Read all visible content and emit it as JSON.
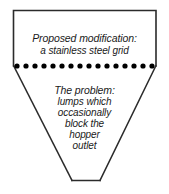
{
  "figure": {
    "kind": "hopper-cross-section-diagram",
    "background_color": "#ffffff",
    "outline_color": "#2b2b2b",
    "dot_color": "#000000",
    "text_color": "#1a1a1a"
  },
  "upper_annotation": {
    "heading": "Proposed modification:",
    "detail": "a stainless steel grid"
  },
  "lower_annotation": {
    "heading": "The problem:",
    "lines": [
      "lumps which",
      "occasionally",
      "block the",
      "hopper",
      "outlet"
    ]
  },
  "grid": {
    "dot_count": 16,
    "description": "stainless steel grid shown as a dotted horizontal line"
  },
  "geometry": {
    "body_top_left": [
      13,
      10
    ],
    "body_top_right": [
      156,
      10
    ],
    "grid_line_y": 66,
    "outlet_left": [
      72,
      180
    ],
    "outlet_right": [
      100,
      180
    ]
  }
}
